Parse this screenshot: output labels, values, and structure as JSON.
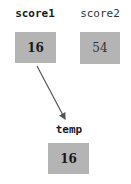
{
  "variables": [
    {
      "name": "score1",
      "value": "16"
    },
    {
      "name": "score2",
      "value": "54"
    },
    {
      "name": "temp",
      "value": "16"
    }
  ],
  "arrow": {
    "from": "score1",
    "to": "temp"
  },
  "colors": {
    "box": "#b4b4b4",
    "arrow": "#555555"
  }
}
